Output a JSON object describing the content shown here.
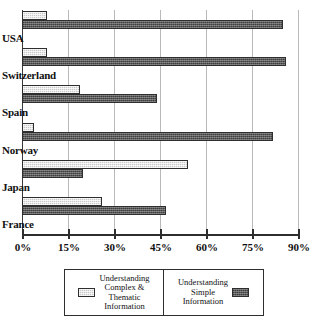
{
  "chart_data": {
    "type": "bar",
    "orientation": "horizontal",
    "title": "",
    "subtitle": "",
    "xlabel": "",
    "ylabel": "",
    "xlim": [
      0,
      90
    ],
    "xticks": [
      "0%",
      "15%",
      "30%",
      "45%",
      "60%",
      "75%",
      "90%"
    ],
    "xtick_values": [
      0,
      15,
      30,
      45,
      60,
      75,
      90
    ],
    "grid": true,
    "grid_axis": "x",
    "legend_position": "bottom",
    "categories": [
      "USA",
      "Switzerland",
      "Spain",
      "Norway",
      "Japan",
      "France"
    ],
    "series": [
      {
        "name": "Understanding\nComplex &\nThematic\nInformation",
        "key": "complex",
        "color": "#c9c9c9",
        "values": [
          8,
          8,
          19,
          4,
          54,
          26
        ]
      },
      {
        "name": "Understanding\nSimple\nInformation",
        "key": "simple",
        "color": "#5a5a5a",
        "values": [
          85,
          86,
          44,
          82,
          20,
          47
        ]
      }
    ]
  },
  "legend": {
    "items": [
      {
        "label": "Understanding\nComplex &\nThematic\nInformation",
        "swatch": "light-hatch-swatch"
      },
      {
        "label": "Understanding\nSimple\nInformation",
        "swatch": "dark-hatch-swatch"
      }
    ]
  }
}
